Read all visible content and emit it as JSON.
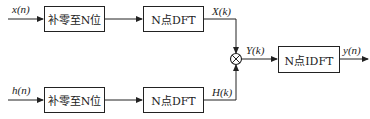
{
  "diagram": {
    "inputs": [
      {
        "label": "x(n)"
      },
      {
        "label": "h(n)"
      }
    ],
    "blocks": {
      "zero_pad_top": "补零至N位",
      "dft_top": "N点DFT",
      "zero_pad_bottom": "补零至N位",
      "dft_bottom": "N点DFT",
      "idft": "N点IDFT"
    },
    "signals": {
      "X": "X(k)",
      "H": "H(k)",
      "Y": "Y(k)",
      "y": "y(n)"
    },
    "multiplier_symbol": "⊗",
    "line_color": "#222222"
  }
}
